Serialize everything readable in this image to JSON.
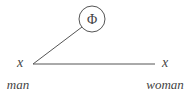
{
  "diagram": {
    "node_top": {
      "symbol": "Φ"
    },
    "left_node": {
      "var": "x",
      "label": "man"
    },
    "right_node": {
      "var": "x",
      "label": "woman"
    },
    "colors": {
      "stroke": "#444444",
      "text": "#444444"
    }
  }
}
